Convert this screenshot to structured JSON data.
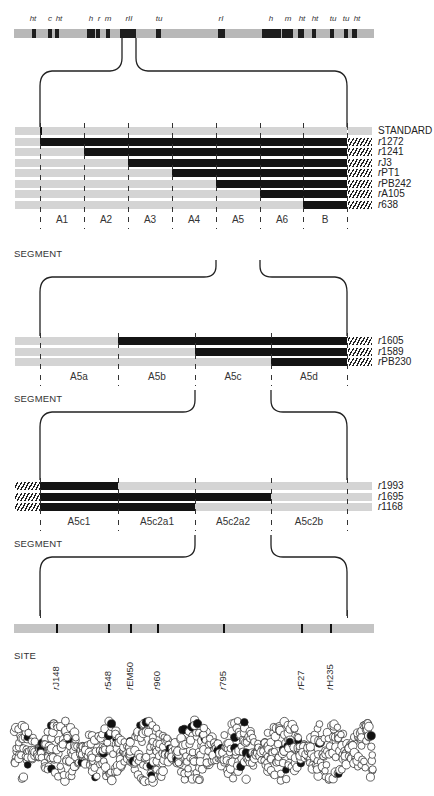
{
  "chromosome": {
    "gene_labels": [
      {
        "label": "ht",
        "x": 33
      },
      {
        "label": "c",
        "x": 50
      },
      {
        "label": "ht",
        "x": 59
      },
      {
        "label": "h",
        "x": 91
      },
      {
        "label": "r",
        "x": 99
      },
      {
        "label": "m",
        "x": 108
      },
      {
        "label": "rII",
        "x": 129
      },
      {
        "label": "tu",
        "x": 159
      },
      {
        "label": "rI",
        "x": 221
      },
      {
        "label": "h",
        "x": 271
      },
      {
        "label": "m",
        "x": 288
      },
      {
        "label": "ht",
        "x": 302
      },
      {
        "label": "ht",
        "x": 315
      },
      {
        "label": "tu",
        "x": 333
      },
      {
        "label": "tu",
        "x": 346
      },
      {
        "label": "ht",
        "x": 357
      }
    ],
    "bands": [
      {
        "x": 32,
        "w": 4
      },
      {
        "x": 48,
        "w": 4
      },
      {
        "x": 55,
        "w": 4
      },
      {
        "x": 87,
        "w": 8
      },
      {
        "x": 96,
        "w": 4
      },
      {
        "x": 106,
        "w": 4
      },
      {
        "x": 120,
        "w": 16
      },
      {
        "x": 156,
        "w": 5
      },
      {
        "x": 218,
        "w": 7
      },
      {
        "x": 262,
        "w": 19
      },
      {
        "x": 282,
        "w": 11
      },
      {
        "x": 298,
        "w": 6
      },
      {
        "x": 312,
        "w": 4
      },
      {
        "x": 330,
        "w": 4
      },
      {
        "x": 344,
        "w": 4
      },
      {
        "x": 352,
        "w": 5
      }
    ]
  },
  "level1": {
    "title": "SEGMENT",
    "rows": [
      {
        "label_prefix": "",
        "label": "STANDARD",
        "del_start": null,
        "hatched": false
      },
      {
        "label_prefix": "r",
        "label": "1272",
        "del_start": 40,
        "hatched": true
      },
      {
        "label_prefix": "r",
        "label": "1241",
        "del_start": 84,
        "hatched": true
      },
      {
        "label_prefix": "r",
        "label": "J3",
        "del_start": 128,
        "hatched": true
      },
      {
        "label_prefix": "r",
        "label": "PT1",
        "del_start": 172,
        "hatched": true
      },
      {
        "label_prefix": "r",
        "label": "PB242",
        "del_start": 216,
        "hatched": true
      },
      {
        "label_prefix": "r",
        "label": "A105",
        "del_start": 260,
        "hatched": true
      },
      {
        "label_prefix": "r",
        "label": "638",
        "del_start": 303,
        "hatched": true
      }
    ],
    "segments": [
      {
        "label": "A1",
        "x": 62
      },
      {
        "label": "A2",
        "x": 106
      },
      {
        "label": "A3",
        "x": 150
      },
      {
        "label": "A4",
        "x": 194
      },
      {
        "label": "A5",
        "x": 238
      },
      {
        "label": "A6",
        "x": 282
      },
      {
        "label": "B",
        "x": 325
      }
    ]
  },
  "level2": {
    "title": "SEGMENT",
    "rows": [
      {
        "label_prefix": "r",
        "label": "1605",
        "del_start": 118
      },
      {
        "label_prefix": "r",
        "label": "1589",
        "del_start": 195
      },
      {
        "label_prefix": "r",
        "label": "PB230",
        "del_start": 271
      }
    ],
    "segments": [
      {
        "label": "A5a",
        "x": 79
      },
      {
        "label": "A5b",
        "x": 157
      },
      {
        "label": "A5c",
        "x": 233
      },
      {
        "label": "A5d",
        "x": 309
      }
    ]
  },
  "level3": {
    "title": "SEGMENT",
    "rows": [
      {
        "label_prefix": "r",
        "label": "1993",
        "del_end": 118
      },
      {
        "label_prefix": "r",
        "label": "1695",
        "del_end": 271
      },
      {
        "label_prefix": "r",
        "label": "1168",
        "del_end": 195
      }
    ],
    "segments": [
      {
        "label": "A5c1",
        "x": 79
      },
      {
        "label": "A5c2a1",
        "x": 157
      },
      {
        "label": "A5c2a2",
        "x": 233
      },
      {
        "label": "A5c2b",
        "x": 309
      }
    ]
  },
  "sites": {
    "title": "SITE",
    "marks": [
      {
        "prefix": "r",
        "label": "J148",
        "x": 56
      },
      {
        "prefix": "r",
        "label": "548",
        "x": 108
      },
      {
        "prefix": "r",
        "label": "EM50",
        "x": 130
      },
      {
        "prefix": "r",
        "label": "960",
        "x": 157
      },
      {
        "prefix": "r",
        "label": "795",
        "x": 223
      },
      {
        "prefix": "r",
        "label": "F27",
        "x": 301
      },
      {
        "prefix": "r",
        "label": "H235",
        "x": 330
      }
    ]
  },
  "dna_model": {
    "label": "DNA double helix space-filling model"
  }
}
